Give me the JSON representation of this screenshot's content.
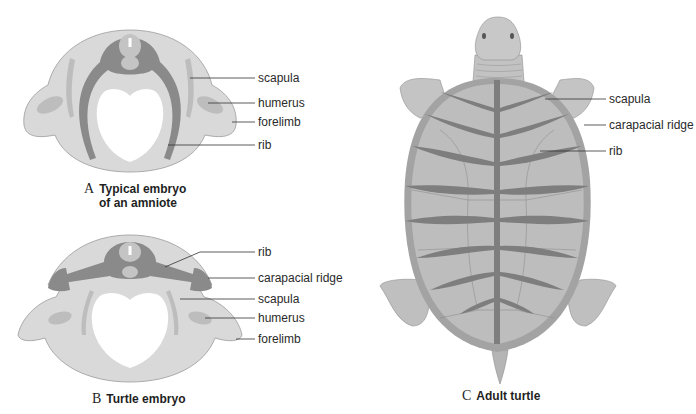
{
  "figure": {
    "panels": [
      {
        "id": "A",
        "letter": "A",
        "caption_line1": "Typical embryo",
        "caption_line2": "of an amniote",
        "labels": [
          "scapula",
          "humerus",
          "forelimb",
          "rib"
        ]
      },
      {
        "id": "B",
        "letter": "B",
        "caption_line1": "Turtle embryo",
        "labels": [
          "rib",
          "carapacial ridge",
          "scapula",
          "humerus",
          "forelimb"
        ]
      },
      {
        "id": "C",
        "letter": "C",
        "caption_line1": "Adult turtle",
        "labels": [
          "scapula",
          "carapacial ridge",
          "rib"
        ]
      }
    ]
  },
  "colors": {
    "background": "#ffffff",
    "tissue_light": "#d9d9d9",
    "tissue_mid": "#bdbdbd",
    "bone_dark": "#8a8a8a",
    "shell": "#b8b8b8",
    "shell_rim": "#a3a3a3",
    "leader_line": "#333333",
    "text": "#2a2a2a"
  }
}
